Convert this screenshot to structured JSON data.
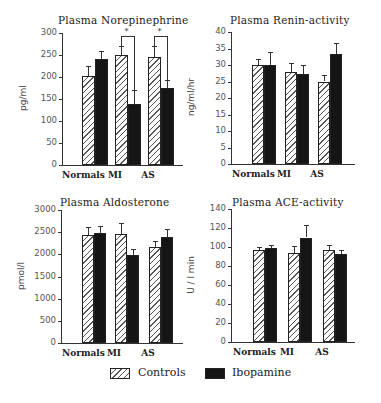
{
  "legend": [
    {
      "label": "Controls",
      "style": "hatched"
    },
    {
      "label": "Ibopamine",
      "style": "solid-black"
    }
  ],
  "colors": {
    "controls_hatch": "#555555",
    "ibopamine_fill": "#151515",
    "axis": "#333333"
  },
  "chart_data": [
    {
      "type": "bar",
      "title": "Plasma Norepinephrine",
      "ylabel": "pg/ml",
      "xlabel": "",
      "categories": [
        "Normals",
        "MI",
        "AS"
      ],
      "yticks": [
        0,
        50,
        100,
        150,
        200,
        250,
        300
      ],
      "ylim": [
        0,
        300
      ],
      "series": [
        {
          "name": "Controls",
          "values": [
            203,
            251,
            246
          ],
          "errors": [
            22,
            20,
            25
          ]
        },
        {
          "name": "Ibopamine",
          "values": [
            240,
            139,
            175
          ],
          "errors": [
            20,
            31,
            18
          ]
        }
      ],
      "annotations": [
        {
          "category": "MI",
          "text": "*",
          "type": "significance-bracket"
        },
        {
          "category": "AS",
          "text": "*",
          "type": "significance-bracket"
        }
      ],
      "grid": false
    },
    {
      "type": "bar",
      "title": "Plasma Renin-activity",
      "ylabel": "ng/ml/hr",
      "xlabel": "",
      "categories": [
        "Normals",
        "MI",
        "AS"
      ],
      "yticks": [
        0,
        5,
        10,
        15,
        20,
        25,
        30,
        35,
        40
      ],
      "ylim": [
        0,
        40
      ],
      "series": [
        {
          "name": "Controls",
          "values": [
            30,
            28,
            25
          ],
          "errors": [
            1.8,
            2.7,
            2.0
          ]
        },
        {
          "name": "Ibopamine",
          "values": [
            30,
            27.3,
            33.3
          ],
          "errors": [
            4.0,
            2.7,
            3.3
          ]
        }
      ],
      "grid": false
    },
    {
      "type": "bar",
      "title": "Plasma Aldosterone",
      "ylabel": "pmol/l",
      "xlabel": "",
      "categories": [
        "Normals",
        "MI",
        "AS"
      ],
      "yticks": [
        0,
        500,
        1000,
        1500,
        2000,
        2500,
        3000
      ],
      "ylim": [
        0,
        3000
      ],
      "series": [
        {
          "name": "Controls",
          "values": [
            2430,
            2450,
            2160
          ],
          "errors": [
            180,
            250,
            140
          ]
        },
        {
          "name": "Ibopamine",
          "values": [
            2470,
            1990,
            2380
          ],
          "errors": [
            180,
            130,
            190
          ]
        }
      ],
      "grid": false
    },
    {
      "type": "bar",
      "title": "Plasma ACE-activity",
      "ylabel": "U / l min",
      "xlabel": "",
      "categories": [
        "Normals",
        "MI",
        "AS"
      ],
      "yticks": [
        0,
        20,
        40,
        60,
        80,
        100,
        120,
        140
      ],
      "ylim": [
        0,
        140
      ],
      "series": [
        {
          "name": "Controls",
          "values": [
            97,
            94,
            97
          ],
          "errors": [
            3,
            7,
            5
          ]
        },
        {
          "name": "Ibopamine",
          "values": [
            99,
            110,
            93
          ],
          "errors": [
            3,
            13,
            4
          ]
        }
      ],
      "grid": false
    }
  ]
}
